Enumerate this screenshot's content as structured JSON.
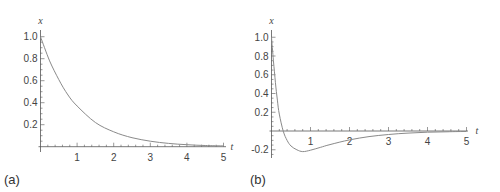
{
  "chart_data": [
    {
      "type": "line",
      "panel_label": "(a)",
      "xlabel": "t",
      "ylabel": "x",
      "xlim": [
        0,
        5
      ],
      "ylim": [
        0,
        1.05
      ],
      "xticks": [
        "1",
        "2",
        "3",
        "4",
        "5"
      ],
      "yticks": [
        "0.2",
        "0.4",
        "0.6",
        "0.8",
        "1.0"
      ],
      "grid": false,
      "series": [
        {
          "name": "x(t)",
          "x": [
            0,
            0.25,
            0.5,
            0.75,
            1,
            1.5,
            2,
            2.5,
            3,
            3.5,
            4,
            4.5,
            5
          ],
          "values": [
            1.0,
            0.78,
            0.61,
            0.47,
            0.37,
            0.22,
            0.135,
            0.082,
            0.05,
            0.03,
            0.018,
            0.011,
            0.007
          ]
        }
      ]
    },
    {
      "type": "line",
      "panel_label": "(b)",
      "xlabel": "t",
      "ylabel": "x",
      "xlim": [
        0,
        5
      ],
      "ylim": [
        -0.28,
        1.05
      ],
      "xticks": [
        "1",
        "2",
        "3",
        "4",
        "5"
      ],
      "yticks": [
        "-0.2",
        "0.2",
        "0.4",
        "0.6",
        "0.8",
        "1.0"
      ],
      "grid": false,
      "series": [
        {
          "name": "x(t)",
          "x": [
            0,
            0.05,
            0.1,
            0.15,
            0.2,
            0.3,
            0.4,
            0.5,
            0.65,
            0.8,
            1.0,
            1.25,
            1.5,
            2,
            2.5,
            3,
            3.5,
            4,
            4.5,
            5
          ],
          "values": [
            1.0,
            0.75,
            0.52,
            0.33,
            0.18,
            0.0,
            -0.1,
            -0.16,
            -0.2,
            -0.22,
            -0.205,
            -0.175,
            -0.145,
            -0.095,
            -0.06,
            -0.037,
            -0.022,
            -0.013,
            -0.008,
            -0.005
          ]
        }
      ]
    }
  ]
}
